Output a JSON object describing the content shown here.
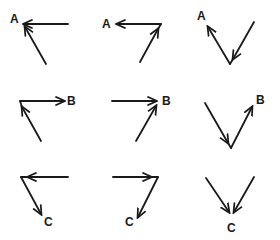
{
  "diagram": {
    "type": "vector-addition-grid",
    "rows": 3,
    "cols": 3,
    "ink_color": "#1a1a1a",
    "background": "#ffffff",
    "labels": {
      "row1": "A",
      "row2": "B",
      "row3": "C"
    },
    "cells": [
      {
        "row": 1,
        "col": 1,
        "label": "A",
        "description": "horizontal arrow pointing left and diagonal arrow pointing up-left meeting at A"
      },
      {
        "row": 1,
        "col": 2,
        "label": "A",
        "description": "diagonal arrow up-right to corner, horizontal arrow pointing left to A"
      },
      {
        "row": 1,
        "col": 3,
        "label": "A",
        "description": "V shape: right arm points down to vertex, left arm points up to A"
      },
      {
        "row": 2,
        "col": 1,
        "label": "B",
        "description": "diagonal arrow up-left to corner, horizontal arrow pointing right to B"
      },
      {
        "row": 2,
        "col": 2,
        "label": "B",
        "description": "horizontal arrow pointing right and diagonal arrow pointing up-right meeting at B"
      },
      {
        "row": 2,
        "col": 3,
        "label": "B",
        "description": "V shape: left arm points down to vertex, right arm points up to B"
      },
      {
        "row": 3,
        "col": 1,
        "label": "C",
        "description": "horizontal arrow pointing left to corner, diagonal arrow pointing down-right to C"
      },
      {
        "row": 3,
        "col": 2,
        "label": "C",
        "description": "horizontal arrow pointing right to corner, diagonal arrow pointing down-left to C"
      },
      {
        "row": 3,
        "col": 3,
        "label": "C",
        "description": "V shape: both arms point down to vertex C"
      }
    ]
  }
}
